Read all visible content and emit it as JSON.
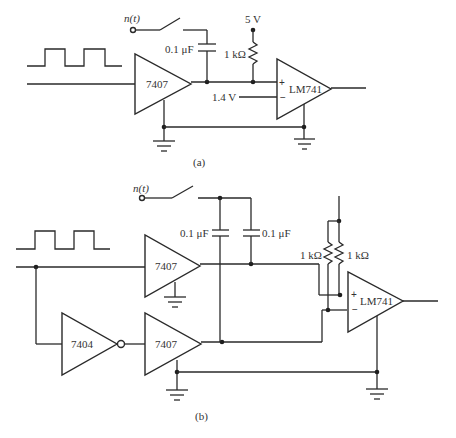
{
  "figure": {
    "panels": [
      {
        "id": "a",
        "caption": "(a)",
        "noise_label": "n(t)",
        "capacitor_label": "0.1 μF",
        "supply_label": "5 V",
        "resistor_label": "1 kΩ",
        "reference_label": "1.4 V",
        "buffer_label": "7407",
        "opamp_label": "LM741",
        "plus_sign": "+",
        "minus_sign": "−"
      },
      {
        "id": "b",
        "caption": "(b)",
        "noise_label": "n(t)",
        "capacitor1_label": "0.1 μF",
        "capacitor2_label": "0.1 μF",
        "resistor1_label": "1 kΩ",
        "resistor2_label": "1 kΩ",
        "buffer1_label": "7407",
        "inverter_label": "7404",
        "buffer2_label": "7407",
        "opamp_label": "LM741",
        "plus_sign": "+",
        "minus_sign": "−"
      }
    ],
    "icons": [
      "square-wave-icon",
      "switch-icon",
      "capacitor-icon",
      "resistor-icon",
      "ground-icon",
      "buffer-gate-icon",
      "inverter-gate-icon",
      "opamp-icon"
    ]
  }
}
